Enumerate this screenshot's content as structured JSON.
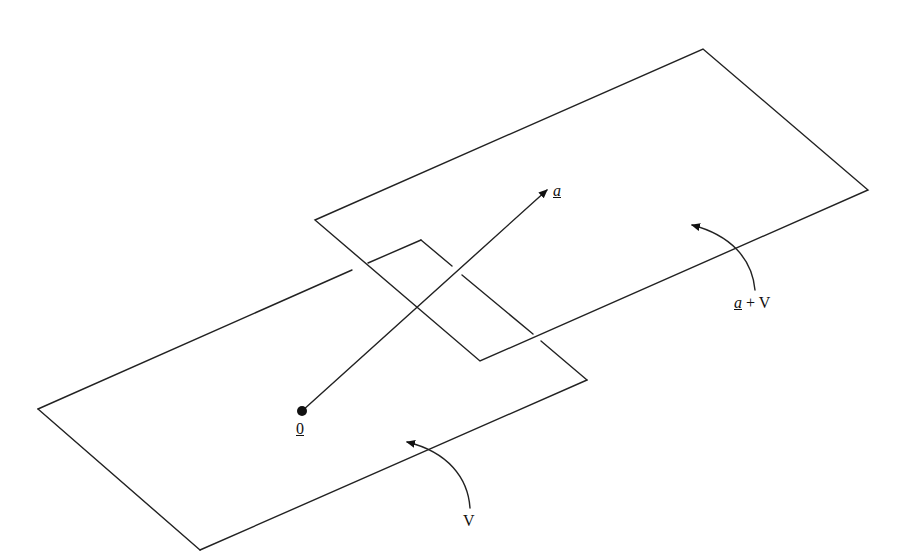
{
  "diagram": {
    "type": "affine-subspace-illustration",
    "planes": [
      {
        "name": "V",
        "label": "V",
        "corners": [
          [
            38,
            409
          ],
          [
            421,
            240
          ],
          [
            587,
            380
          ],
          [
            200,
            550
          ]
        ]
      },
      {
        "name": "a+V",
        "label_vector": "a",
        "label_op": "+",
        "label_space": "V",
        "corners": [
          [
            315,
            220
          ],
          [
            703,
            49
          ],
          [
            868,
            190
          ],
          [
            480,
            361
          ]
        ]
      }
    ],
    "origin": {
      "label": "0",
      "point": [
        302,
        411
      ]
    },
    "vector": {
      "label": "a",
      "from": [
        302,
        411
      ],
      "to": [
        549,
        188
      ]
    },
    "colors": {
      "line": "#222222",
      "background": "#ffffff"
    }
  }
}
